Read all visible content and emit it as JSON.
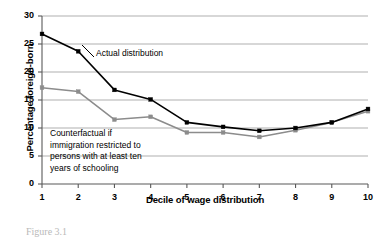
{
  "figure": {
    "caption": "Figure 3.1"
  },
  "chart_data": {
    "type": "line",
    "title": "",
    "xlabel": "Decile of wage distribution",
    "ylabel": "Percentage foreign-born",
    "categories": [
      "1",
      "2",
      "3",
      "4",
      "5",
      "6",
      "7",
      "8",
      "9",
      "10"
    ],
    "x": [
      1,
      2,
      3,
      4,
      5,
      6,
      7,
      8,
      9,
      10
    ],
    "xlim": [
      1,
      10
    ],
    "ylim": [
      0,
      30
    ],
    "yticks": [
      "0",
      "5",
      "10",
      "15",
      "20",
      "25",
      "30"
    ],
    "ytick_values": [
      0,
      5,
      10,
      15,
      20,
      25,
      30
    ],
    "grid": "horizontal",
    "legend_position": "inline-annotation",
    "series": [
      {
        "name": "Actual distribution",
        "color": "#000000",
        "marker": "square",
        "values": [
          26.8,
          23.7,
          16.8,
          15.1,
          11.0,
          10.2,
          9.5,
          10.0,
          11.0,
          13.4
        ]
      },
      {
        "name": "Counterfactual if immigration restricted to persons with at least ten years of schooling",
        "color": "#8c8c8c",
        "marker": "square",
        "values": [
          17.2,
          16.5,
          11.5,
          12.0,
          9.2,
          9.2,
          8.4,
          9.6,
          11.0,
          13.0
        ]
      }
    ],
    "annotations": [
      {
        "id": "actual",
        "text": "Actual distribution",
        "lines": [
          "Actual distribution"
        ]
      },
      {
        "id": "counterfactual",
        "text": "Counterfactual if immigration restricted to persons with at least ten years of schooling",
        "lines": [
          "Counterfactual if",
          "immigration restricted to",
          "persons with at least ten",
          "years of schooling"
        ]
      }
    ],
    "colors": {
      "actual_line": "#000000",
      "counterfactual_line": "#8c8c8c",
      "gridline": "#a6a6a6",
      "axis": "#595959",
      "background": "#ffffff"
    }
  }
}
